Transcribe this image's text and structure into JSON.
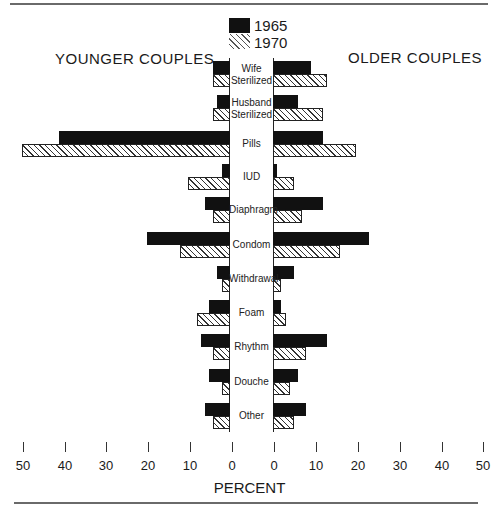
{
  "chart_data": {
    "type": "bar",
    "orientation": "horizontal-butterfly",
    "title": "",
    "left_panel_title": "YOUNGER COUPLES",
    "right_panel_title": "OLDER COUPLES",
    "xlabel": "PERCENT",
    "xlim": [
      0,
      50
    ],
    "x_ticks_left": [
      50,
      40,
      30,
      20,
      10,
      0
    ],
    "x_ticks_right": [
      0,
      10,
      20,
      30,
      40,
      50
    ],
    "legend": [
      {
        "name": "1965",
        "style": "solid-black"
      },
      {
        "name": "1970",
        "style": "diagonal-hatch"
      }
    ],
    "legend_position": "top-center",
    "categories": [
      "Wife Sterilized",
      "Husband Sterilized",
      "Pills",
      "IUD",
      "Diaphragm",
      "Condom",
      "Withdrawal",
      "Foam",
      "Rhythm",
      "Douche",
      "Other"
    ],
    "series": [
      {
        "name": "Younger couples 1965",
        "values": [
          4,
          3,
          41,
          2,
          6,
          20,
          3,
          5,
          7,
          5,
          6
        ]
      },
      {
        "name": "Younger couples 1970",
        "values": [
          4,
          4,
          50,
          10,
          4,
          12,
          2,
          8,
          4,
          2,
          4
        ]
      },
      {
        "name": "Older couples 1965",
        "values": [
          9,
          6,
          12,
          1,
          12,
          23,
          5,
          2,
          13,
          6,
          8
        ]
      },
      {
        "name": "Older couples 1970",
        "values": [
          13,
          12,
          20,
          5,
          7,
          16,
          2,
          3,
          8,
          4,
          5
        ]
      }
    ],
    "grid": false
  },
  "labels": {
    "younger": "YOUNGER COUPLES",
    "older": "OLDER COUPLES",
    "legend_1965": "1965",
    "legend_1970": "1970",
    "axis_title": "PERCENT",
    "categories": [
      [
        "Wife",
        "Sterilized"
      ],
      [
        "Husband",
        "Sterilized"
      ],
      [
        "Pills"
      ],
      [
        "IUD"
      ],
      [
        "Diaphragm"
      ],
      [
        "Condom"
      ],
      [
        "Withdrawal"
      ],
      [
        "Foam"
      ],
      [
        "Rhythm"
      ],
      [
        "Douche"
      ],
      [
        "Other"
      ]
    ],
    "ticks_left": [
      "50",
      "40",
      "30",
      "20",
      "10",
      "0"
    ],
    "ticks_right": [
      "0",
      "10",
      "20",
      "30",
      "40",
      "50"
    ]
  }
}
